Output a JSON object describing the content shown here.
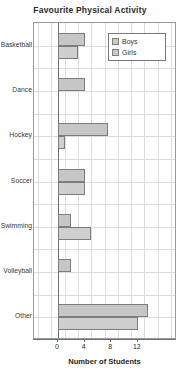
{
  "chart_data": {
    "type": "bar",
    "orientation": "horizontal",
    "title": "Favourite Physical Activity",
    "xlabel": "Number of Students",
    "ylabel": "",
    "xlim": [
      0,
      16
    ],
    "xticks": [
      0,
      4,
      8,
      12
    ],
    "xtick_labels": [
      "0",
      "4",
      "8",
      "12"
    ],
    "grid": true,
    "legend_position": "top-right",
    "categories": [
      "Basketball",
      "Dance",
      "Hockey",
      "Soccer",
      "Swimming",
      "Volleyball",
      "Other"
    ],
    "series": [
      {
        "name": "Boys",
        "color": "#c6c6c6",
        "values": [
          4,
          4,
          7.5,
          4,
          2,
          2,
          13.5
        ]
      },
      {
        "name": "Girls",
        "color": "#cfcfcf",
        "values": [
          3,
          0,
          1,
          4,
          5,
          0,
          12
        ]
      }
    ]
  },
  "legend": {
    "items": [
      {
        "label": "Boys"
      },
      {
        "label": "Girls"
      }
    ]
  },
  "colors": {
    "bar_fill": "#c6c6c6",
    "bar_border": "#7d7d7d",
    "grid": "#dcdcdc",
    "axis": "#6f6f6f",
    "text": "#2b2b2b"
  }
}
